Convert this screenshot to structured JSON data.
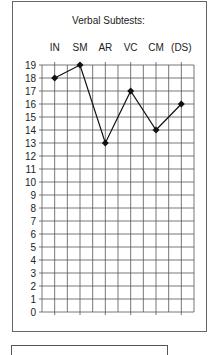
{
  "chart_data": {
    "type": "line",
    "title": "Verbal Subtests:",
    "categories": [
      "IN",
      "SM",
      "AR",
      "VC",
      "CM",
      "(DS)"
    ],
    "series": [
      {
        "name": "Verbal Subtests",
        "values": [
          18,
          19,
          13,
          17,
          14,
          16
        ]
      }
    ],
    "xlabel": "",
    "ylabel": "",
    "ylim": [
      0,
      19
    ],
    "yticks": [
      0,
      1,
      2,
      3,
      4,
      5,
      6,
      7,
      8,
      9,
      10,
      11,
      12,
      13,
      14,
      15,
      16,
      17,
      18,
      19
    ],
    "grid": true,
    "x_axis_position": "top",
    "marker": "diamond",
    "legend": null
  },
  "colors": {
    "line": "#111111",
    "grid": "#555555",
    "border": "#666666"
  }
}
